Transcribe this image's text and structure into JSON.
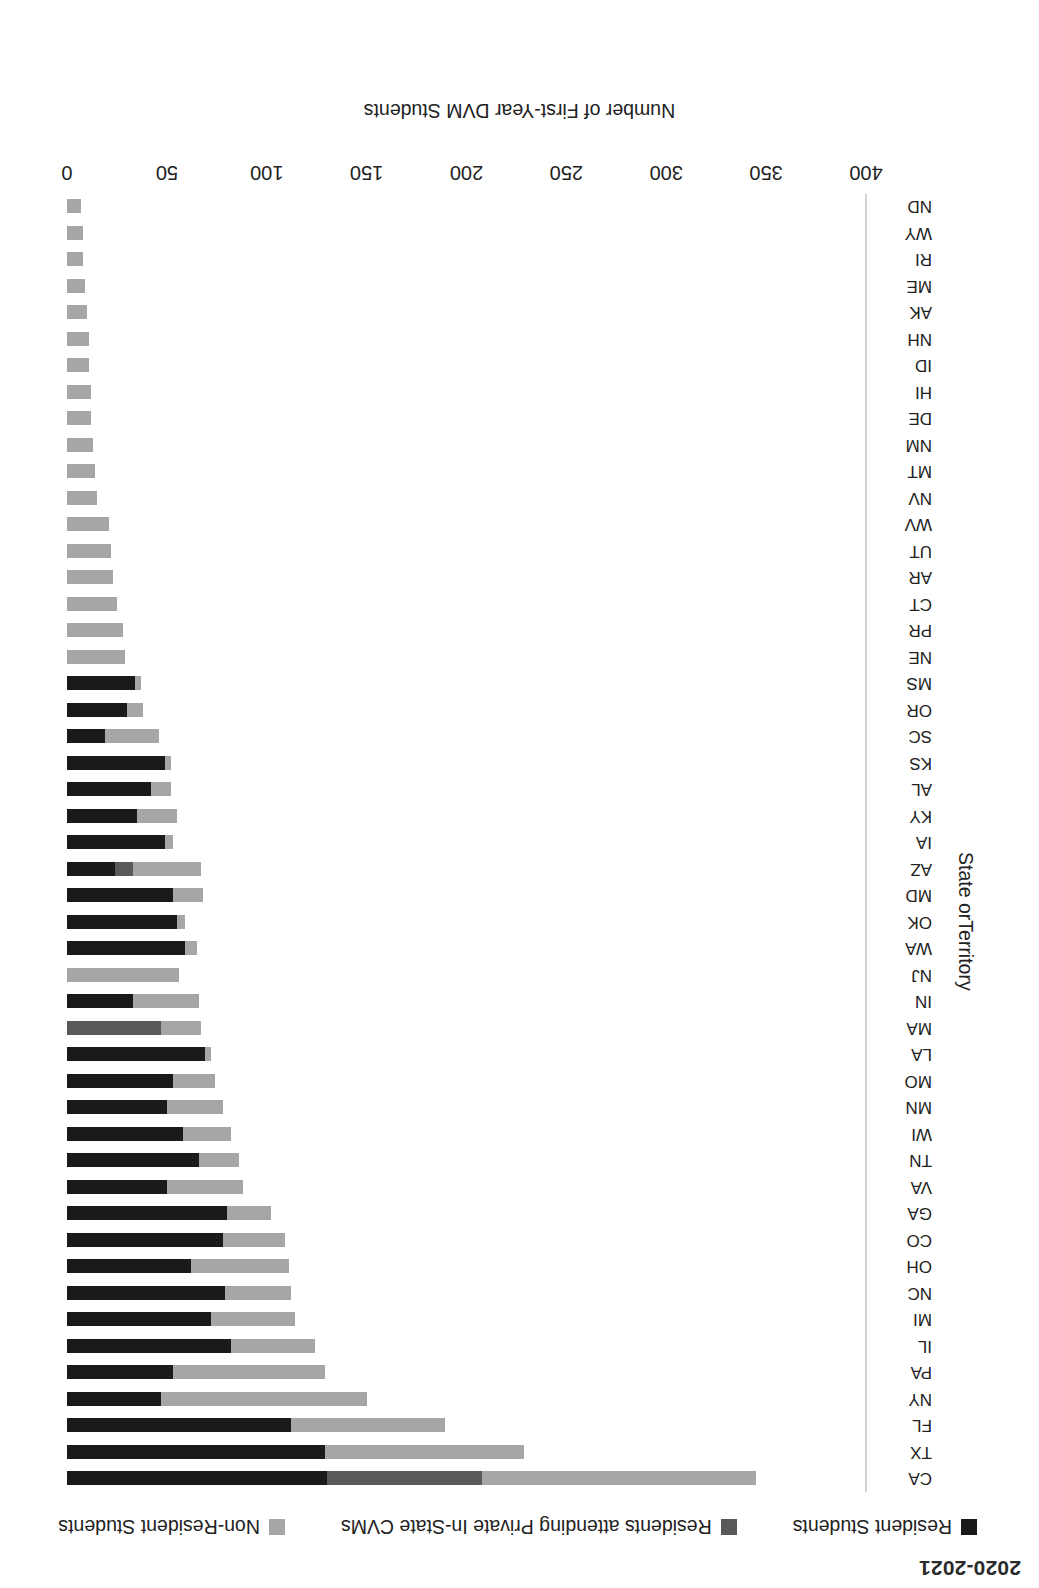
{
  "chart_title": "2020-2021",
  "legend": {
    "position": "top",
    "items": [
      {
        "label": "Resident Students",
        "color": "#1a1a1a",
        "icon": "square-swatch-icon"
      },
      {
        "label": "Residents attending Private In-State CVMs",
        "color": "#595959",
        "icon": "square-swatch-icon"
      },
      {
        "label": "Non-Resident Students",
        "color": "#a6a6a6",
        "icon": "square-swatch-icon"
      }
    ]
  },
  "axes": {
    "value_axis_title": "Number of First-Year DVM Students",
    "category_axis_title": "State orTerritory",
    "value_ticks": [
      "0",
      "50",
      "100",
      "150",
      "200",
      "250",
      "300",
      "350",
      "400"
    ],
    "value_min": 0,
    "value_max": 400
  },
  "chart_data": {
    "type": "bar",
    "orientation": "horizontal",
    "stacked": true,
    "title": "2020-2021",
    "xlabel": "Number of First-Year DVM Students",
    "ylabel": "State orTerritory",
    "xlim": [
      0,
      400
    ],
    "grid": false,
    "legend_position": "top",
    "categories": [
      "CA",
      "TX",
      "FL",
      "NY",
      "PA",
      "IL",
      "MI",
      "NC",
      "OH",
      "CO",
      "GA",
      "VA",
      "TN",
      "WI",
      "MN",
      "MO",
      "LA",
      "MA",
      "IN",
      "NJ",
      "WA",
      "OK",
      "MD",
      "AZ",
      "IA",
      "KY",
      "AL",
      "KS",
      "SC",
      "OR",
      "MS",
      "NE",
      "PR",
      "CT",
      "AR",
      "UT",
      "WV",
      "NV",
      "MT",
      "NM",
      "DE",
      "HI",
      "ID",
      "NH",
      "AK",
      "ME",
      "RI",
      "WY",
      "ND"
    ],
    "series": [
      {
        "name": "Resident Students",
        "color": "#1a1a1a",
        "values": [
          130,
          129,
          112,
          47,
          53,
          82,
          72,
          79,
          62,
          78,
          80,
          50,
          66,
          58,
          50,
          53,
          69,
          0,
          33,
          0,
          59,
          55,
          53,
          24,
          49,
          35,
          42,
          49,
          19,
          30,
          34,
          0,
          0,
          0,
          0,
          0,
          0,
          0,
          0,
          0,
          0,
          0,
          0,
          0,
          0,
          0,
          0,
          0,
          0
        ]
      },
      {
        "name": "Residents attending Private In-State CVMs",
        "color": "#595959",
        "values": [
          78,
          0,
          0,
          0,
          0,
          0,
          0,
          0,
          0,
          0,
          0,
          0,
          0,
          0,
          0,
          0,
          0,
          47,
          0,
          0,
          0,
          0,
          0,
          9,
          0,
          0,
          0,
          0,
          0,
          0,
          0,
          0,
          0,
          0,
          0,
          0,
          0,
          0,
          0,
          0,
          0,
          0,
          0,
          0,
          0,
          0,
          0,
          0,
          0
        ]
      },
      {
        "name": "Non-Resident Students",
        "color": "#a6a6a6",
        "values": [
          137,
          100,
          77,
          103,
          76,
          42,
          42,
          33,
          49,
          31,
          22,
          38,
          20,
          24,
          28,
          21,
          3,
          20,
          33,
          56,
          6,
          4,
          15,
          34,
          4,
          20,
          10,
          3,
          27,
          8,
          3,
          29,
          28,
          25,
          23,
          22,
          21,
          15,
          14,
          13,
          12,
          12,
          11,
          11,
          10,
          9,
          8,
          8,
          7
        ]
      }
    ],
    "totals": [
      345,
      229,
      189,
      150,
      129,
      124,
      114,
      112,
      111,
      109,
      102,
      88,
      86,
      82,
      78,
      74,
      72,
      67,
      66,
      56,
      65,
      59,
      68,
      67,
      53,
      55,
      52,
      52,
      46,
      38,
      37,
      29,
      28,
      25,
      23,
      22,
      21,
      15,
      14,
      13,
      12,
      12,
      11,
      11,
      10,
      9,
      8,
      8,
      7
    ]
  }
}
